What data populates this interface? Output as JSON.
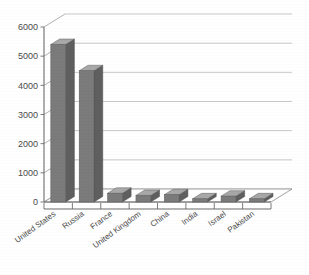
{
  "chart_data": {
    "type": "bar",
    "title": "",
    "subtitle": "",
    "xlabel": "",
    "ylabel": "",
    "ylim": [
      0,
      6000
    ],
    "ytick_labels": [
      "0",
      "1000",
      "2000",
      "3000",
      "4000",
      "5000",
      "6000"
    ],
    "ytick_values": [
      0,
      1000,
      2000,
      3000,
      4000,
      5000,
      6000
    ],
    "grid": true,
    "legend": "none",
    "style": "3d-column",
    "bar_color": "#7b7b7b",
    "bar_top_color": "#a8a8a8",
    "bar_side_color": "#5f5f5f",
    "grid_color": "#b9b9b9",
    "axis_color": "#6d6d6d",
    "categories": [
      "United States",
      "Russia",
      "France",
      "United Kingdom",
      "China",
      "India",
      "Israel",
      "Pakistan"
    ],
    "values": [
      5400,
      4500,
      300,
      225,
      250,
      110,
      200,
      110
    ]
  }
}
